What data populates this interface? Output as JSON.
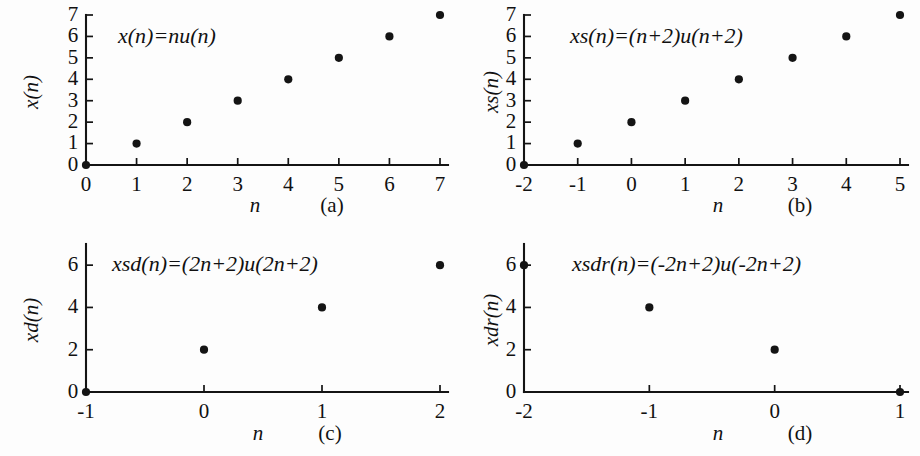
{
  "figure": {
    "background_color": "#fdfdfd",
    "ink_color": "#141414",
    "width": 920,
    "height": 456
  },
  "chart_data": [
    {
      "type": "scatter",
      "panel_tag": "(a)",
      "title": "x(n)=nu(n)",
      "xlabel": "n",
      "ylabel": "x(n)",
      "x": [
        0,
        1,
        2,
        3,
        4,
        5,
        6,
        7
      ],
      "values": [
        0,
        1,
        2,
        3,
        4,
        5,
        6,
        7
      ],
      "xticks": [
        "0",
        "1",
        "2",
        "3",
        "4",
        "5",
        "6",
        "7"
      ],
      "xtick_values": [
        0,
        1,
        2,
        3,
        4,
        5,
        6,
        7
      ],
      "yticks": [
        "0",
        "1",
        "2",
        "3",
        "4",
        "5",
        "6",
        "7"
      ],
      "ytick_values": [
        0,
        1,
        2,
        3,
        4,
        5,
        6,
        7
      ],
      "xlim": [
        0,
        7
      ],
      "ylim": [
        0,
        7
      ],
      "grid": false,
      "legend": "none"
    },
    {
      "type": "scatter",
      "panel_tag": "(b)",
      "title": "xs(n)=(n+2)u(n+2)",
      "xlabel": "n",
      "ylabel": "xs(n)",
      "x": [
        -2,
        -1,
        0,
        1,
        2,
        3,
        4,
        5
      ],
      "values": [
        0,
        1,
        2,
        3,
        4,
        5,
        6,
        7
      ],
      "xticks": [
        "-2",
        "-1",
        "0",
        "1",
        "2",
        "3",
        "4",
        "5"
      ],
      "xtick_values": [
        -2,
        -1,
        0,
        1,
        2,
        3,
        4,
        5
      ],
      "yticks": [
        "0",
        "1",
        "2",
        "3",
        "4",
        "5",
        "6",
        "7"
      ],
      "ytick_values": [
        0,
        1,
        2,
        3,
        4,
        5,
        6,
        7
      ],
      "xlim": [
        -2,
        5
      ],
      "ylim": [
        0,
        7
      ],
      "grid": false,
      "legend": "none"
    },
    {
      "type": "scatter",
      "panel_tag": "(c)",
      "title": "xsd(n)=(2n+2)u(2n+2)",
      "xlabel": "n",
      "ylabel": "xd(n)",
      "x": [
        -1,
        0,
        1,
        2
      ],
      "values": [
        0,
        2,
        4,
        6
      ],
      "xticks": [
        "-1",
        "0",
        "1",
        "2"
      ],
      "xtick_values": [
        -1,
        0,
        1,
        2
      ],
      "yticks": [
        "0",
        "2",
        "4",
        "6"
      ],
      "ytick_values": [
        0,
        2,
        4,
        6
      ],
      "xlim": [
        -1,
        2
      ],
      "ylim": [
        0,
        7
      ],
      "grid": false,
      "legend": "none"
    },
    {
      "type": "scatter",
      "panel_tag": "(d)",
      "title": "xsdr(n)=(-2n+2)u(-2n+2)",
      "xlabel": "n",
      "ylabel": "xdr(n)",
      "x": [
        -2,
        -1,
        0,
        1
      ],
      "values": [
        6,
        4,
        2,
        0
      ],
      "xticks": [
        "-2",
        "-1",
        "0",
        "1"
      ],
      "xtick_values": [
        -2,
        -1,
        0,
        1
      ],
      "yticks": [
        "0",
        "2",
        "4",
        "6"
      ],
      "ytick_values": [
        0,
        2,
        4,
        6
      ],
      "xlim": [
        -2,
        1
      ],
      "ylim": [
        0,
        7
      ],
      "grid": false,
      "legend": "none"
    }
  ]
}
